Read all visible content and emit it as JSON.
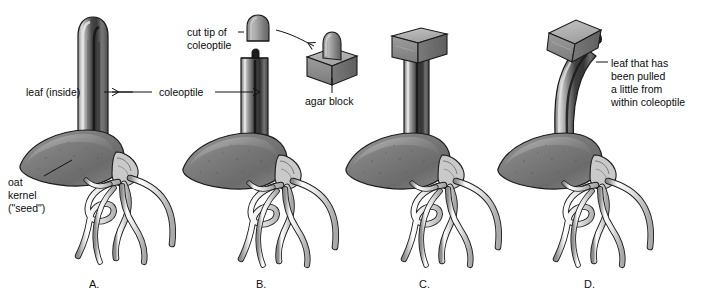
{
  "figure": {
    "background_color": "#ffffff",
    "ink_color": "#111111",
    "width": 706,
    "height": 300
  },
  "labels": {
    "leaf_inside": "leaf (inside)",
    "coleoptile": "coleoptile",
    "oat_kernel_line1": "oat",
    "oat_kernel_line2": "kernel",
    "oat_kernel_line3": "(\"seed\")",
    "cut_tip_line1": "cut tip of",
    "cut_tip_line2": "coleoptile",
    "agar_block": "agar block",
    "pulled_leaf_line1": "leaf that has",
    "pulled_leaf_line2": "been pulled",
    "pulled_leaf_line3": "a little from",
    "pulled_leaf_line4": "within coleoptile"
  },
  "panels": [
    {
      "letter": "A.",
      "description": "intact seedling with whole coleoptile, rounded tip, leaf visible inside"
    },
    {
      "letter": "B.",
      "description": "seedling with coleoptile tip cut off, flat top, small dark leaf nub"
    },
    {
      "letter": "C.",
      "description": "agar block placed squarely on top of decapitated coleoptile"
    },
    {
      "letter": "D.",
      "description": "coleoptile bent with agar block tilted on a protruding leaf"
    }
  ],
  "inset": {
    "cut_tip_shape": "dome",
    "agar_block_shape": "cube with dome seated on top"
  },
  "colors": {
    "outline": "#111111",
    "seed_dark": "#6e6e6e",
    "seed_light": "#b9b9b9",
    "coleoptile_dark": "#3c3c3c",
    "coleoptile_light": "#c9c9c9",
    "root_light": "#f2f2f2",
    "root_shade": "#c4c4c4",
    "agar_top": "#b2b2b2",
    "agar_front": "#8e8e8e",
    "agar_side": "#6f6f6f",
    "leaf_dark": "#1f1f1f"
  }
}
